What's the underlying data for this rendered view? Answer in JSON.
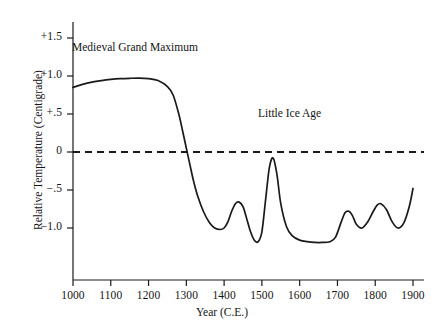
{
  "chart_data": {
    "type": "line",
    "title": "",
    "xlabel": "Year (C.E.)",
    "ylabel": "Relative Temperature (Centigrade)",
    "xlim": [
      950,
      1950
    ],
    "ylim": [
      -1.45,
      1.75
    ],
    "grid": false,
    "legend": null,
    "xticks": [
      1000,
      1100,
      1200,
      1300,
      1400,
      1500,
      1600,
      1700,
      1800,
      1900
    ],
    "xticklabels": [
      "1000",
      "1100",
      "1200",
      "1300",
      "1400",
      "1500",
      "1600",
      "1700",
      "1800",
      "1900"
    ],
    "yticks": [
      1.5,
      1.0,
      0.5,
      0.0,
      -0.5,
      -1.0
    ],
    "yticklabels": [
      "+1.5",
      "+1.0",
      "+.5",
      "0",
      "−.5",
      "−1.0"
    ],
    "reference_lines": [
      {
        "name": "zero-line",
        "y": 0.0,
        "style": "dashed",
        "color": "#1a1a1a"
      }
    ],
    "annotations": [
      {
        "name": "medieval-grand-maximum",
        "text": "Medieval Grand Maximum",
        "x": 1180,
        "y": 1.35
      },
      {
        "name": "little-ice-age",
        "text": "Little Ice Age",
        "x": 1620,
        "y": 0.5
      }
    ],
    "series": [
      {
        "name": "relative-temperature",
        "color": "#1a1a1a",
        "x": [
          950,
          975,
          1000,
          1025,
          1050,
          1075,
          1100,
          1125,
          1150,
          1175,
          1200,
          1225,
          1250,
          1265,
          1280,
          1290,
          1300,
          1310,
          1320,
          1330,
          1345,
          1360,
          1375,
          1390,
          1400,
          1410,
          1420,
          1430,
          1440,
          1450,
          1460,
          1470,
          1480,
          1490,
          1500,
          1510,
          1520,
          1530,
          1540,
          1550,
          1565,
          1580,
          1600,
          1620,
          1640,
          1660,
          1680,
          1695,
          1710,
          1720,
          1730,
          1740,
          1750,
          1765,
          1780,
          1795,
          1805,
          1815,
          1830,
          1845,
          1860,
          1875,
          1890,
          1900
        ],
        "y": [
          0.74,
          0.8,
          0.85,
          0.89,
          0.92,
          0.94,
          0.955,
          0.965,
          0.97,
          0.972,
          0.965,
          0.94,
          0.86,
          0.75,
          0.5,
          0.28,
          0.05,
          -0.18,
          -0.4,
          -0.58,
          -0.78,
          -0.92,
          -1.0,
          -1.02,
          -1.0,
          -0.92,
          -0.78,
          -0.68,
          -0.66,
          -0.72,
          -0.88,
          -1.05,
          -1.16,
          -1.18,
          -1.05,
          -0.62,
          -0.2,
          -0.08,
          -0.3,
          -0.68,
          -0.98,
          -1.1,
          -1.16,
          -1.18,
          -1.19,
          -1.19,
          -1.18,
          -1.12,
          -0.92,
          -0.8,
          -0.78,
          -0.84,
          -0.95,
          -1.0,
          -0.92,
          -0.78,
          -0.7,
          -0.68,
          -0.76,
          -0.92,
          -1.0,
          -0.94,
          -0.72,
          -0.48
        ]
      }
    ]
  }
}
